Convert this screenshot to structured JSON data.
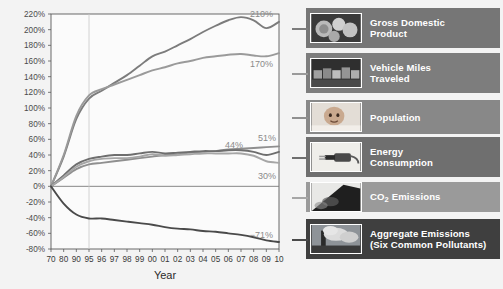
{
  "chart_data": {
    "type": "line",
    "title": "",
    "xlabel": "Year",
    "ylabel": "",
    "ylim": [
      -80,
      220
    ],
    "ytick_step": 20,
    "grid": true,
    "legend_position": "right",
    "categories": [
      "70",
      "80",
      "90",
      "95",
      "96",
      "97",
      "98",
      "99",
      "00",
      "01",
      "02",
      "03",
      "04",
      "05",
      "06",
      "07",
      "08",
      "09",
      "10"
    ],
    "ytick_labels": [
      "220%",
      "200%",
      "180%",
      "160%",
      "140%",
      "120%",
      "100%",
      "80%",
      "60%",
      "40%",
      "20%",
      "0%",
      "-20%",
      "-40%",
      "-60%",
      "-80%"
    ],
    "series": [
      {
        "name": "Gross Domestic Product",
        "color": "#7c7c7c",
        "end_label": "210%",
        "values": [
          0,
          38,
          86,
          112,
          122,
          132,
          142,
          154,
          166,
          172,
          180,
          188,
          197,
          205,
          212,
          216,
          212,
          202,
          210
        ]
      },
      {
        "name": "Vehicle Miles Traveled",
        "color": "#9a9a9a",
        "end_label": "170%",
        "values": [
          0,
          40,
          90,
          116,
          124,
          130,
          136,
          142,
          148,
          152,
          157,
          160,
          164,
          166,
          168,
          169,
          167,
          166,
          170
        ]
      },
      {
        "name": "Population",
        "color": "#8f8f8f",
        "end_label": "51%",
        "values": [
          0,
          11,
          22,
          28,
          30,
          32,
          34,
          36,
          38,
          40,
          41,
          43,
          44,
          45,
          47,
          48,
          49,
          50,
          51
        ]
      },
      {
        "name": "Energy Consumption",
        "color": "#6e6e6e",
        "end_label": "44%",
        "values": [
          0,
          14,
          28,
          35,
          38,
          40,
          40,
          42,
          44,
          42,
          43,
          44,
          45,
          45,
          46,
          46,
          44,
          40,
          44
        ]
      },
      {
        "name": "CO2 Emissions",
        "color": "#a6a6a6",
        "end_label": "30%",
        "values": [
          0,
          12,
          25,
          32,
          35,
          36,
          36,
          38,
          41,
          39,
          40,
          41,
          42,
          42,
          42,
          42,
          39,
          32,
          30
        ]
      },
      {
        "name": "Aggregate Emissions (Six Common Pollutants)",
        "color": "#4a4a4a",
        "end_label": "-71%",
        "values": [
          0,
          -22,
          -36,
          -41,
          -41,
          -43,
          -45,
          -47,
          -49,
          -52,
          -54,
          -55,
          -57,
          -58,
          -60,
          -62,
          -65,
          -69,
          -71
        ]
      }
    ]
  },
  "legend": {
    "items": [
      {
        "label_line1": "Gross Domestic",
        "label_line2": "Product",
        "thumb": "money-photo-thumb",
        "bg": "#767676"
      },
      {
        "label_line1": "Vehicle Miles",
        "label_line2": "Traveled",
        "thumb": "traffic-photo-thumb",
        "bg": "#7d7d7d"
      },
      {
        "label_line1": "Population",
        "label_line2": "",
        "thumb": "baby-photo-thumb",
        "bg": "#888888"
      },
      {
        "label_line1": "Energy",
        "label_line2": "Consumption",
        "thumb": "plug-photo-thumb",
        "bg": "#6f6f6f"
      },
      {
        "label_line1": "CO2 Emissions",
        "label_line2": "",
        "thumb": "tailpipe-photo-thumb",
        "bg": "#9a9a9a"
      },
      {
        "label_line1": "Aggregate Emissions",
        "label_line2": "(Six Common Pollutants)",
        "thumb": "smokestack-photo-thumb",
        "bg": "#3f3f3f"
      }
    ]
  },
  "colors": {
    "page_background": "#f3f3f3",
    "plot_background": "#fbfbfb",
    "axis": "#5a5a5a",
    "grid": "#c9c9c9",
    "label_text": "#8a8a8a"
  }
}
